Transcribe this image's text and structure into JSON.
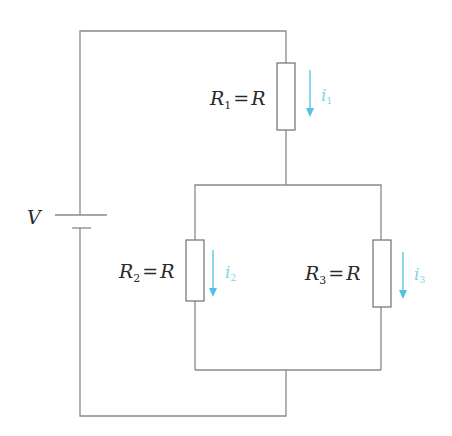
{
  "diagram": {
    "type": "circuit-schematic",
    "source": {
      "label": "V"
    },
    "resistors": [
      {
        "id": "R1",
        "symbol": "R",
        "subscript": "1",
        "equals": "=",
        "value": "R",
        "current": {
          "symbol": "i",
          "subscript": "1"
        }
      },
      {
        "id": "R2",
        "symbol": "R",
        "subscript": "2",
        "equals": "=",
        "value": "R",
        "current": {
          "symbol": "i",
          "subscript": "2"
        }
      },
      {
        "id": "R3",
        "symbol": "R",
        "subscript": "3",
        "equals": "=",
        "value": "R",
        "current": {
          "symbol": "i",
          "subscript": "3"
        }
      }
    ],
    "topology": "R1 in series with parallel combination of R2 and R3, driven by battery V",
    "colors": {
      "wire": "#8a8a8a",
      "current_arrow": "#4fc3e0",
      "text": "#2a2a2a"
    }
  }
}
